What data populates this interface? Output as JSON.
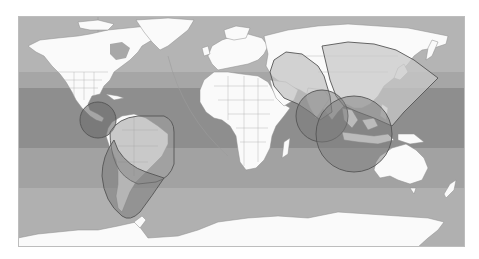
{
  "map": {
    "projection": "equirectangular",
    "style": "grayscale world map",
    "colors": {
      "page_background": "#ffffff",
      "ocean_polar": "#b4b4b4",
      "ocean_mid": "#a2a2a2",
      "ocean_tropical": "#8e8e8e",
      "land": "#fafafa",
      "borders": "#9a9a9a",
      "beam_fill_light": "#c8c8c8",
      "beam_fill_dark": "#7c7c7c",
      "beam_stroke": "#555555"
    },
    "coverage_beams": [
      {
        "name": "central-america-beam",
        "shape": "circle",
        "region": "Central America / Eastern Pacific"
      },
      {
        "name": "northern-south-america-beam",
        "shape": "rounded-sector",
        "region": "Northern South America"
      },
      {
        "name": "southern-south-america-beam",
        "shape": "shield",
        "region": "Southern South America"
      },
      {
        "name": "west-asia-beam",
        "shape": "polygon",
        "region": "Middle East / South Asia"
      },
      {
        "name": "east-asia-beam",
        "shape": "sector",
        "region": "China / Japan / Western Pacific"
      },
      {
        "name": "indian-ocean-beam",
        "shape": "circle",
        "region": "Indian Ocean"
      },
      {
        "name": "southeast-asia-beam",
        "shape": "circle",
        "region": "Southeast Asia / Indonesia"
      }
    ]
  }
}
